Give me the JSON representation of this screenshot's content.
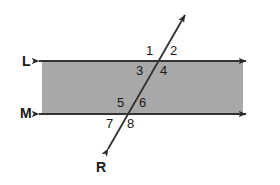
{
  "figure": {
    "type": "geometry-diagram",
    "background_color": "#ffffff",
    "band_fill_color": "#a8a8a8",
    "stroke_color": "#333333",
    "text_color": "#1a1a1a"
  },
  "lines": {
    "upper": {
      "label": "L",
      "label_x": 22,
      "label_y": 54
    },
    "lower": {
      "label": "M",
      "label_y": 106,
      "label_x": 20
    },
    "transversal": {
      "label": "R",
      "label_x": 96,
      "label_y": 160
    }
  },
  "angles": [
    {
      "label": "1",
      "x": 146,
      "y": 44
    },
    {
      "label": "2",
      "x": 170,
      "y": 44
    },
    {
      "label": "3",
      "x": 136,
      "y": 64
    },
    {
      "label": "4",
      "x": 160,
      "y": 64
    },
    {
      "label": "5",
      "x": 117,
      "y": 96
    },
    {
      "label": "6",
      "x": 139,
      "y": 96
    },
    {
      "label": "7",
      "x": 106,
      "y": 117
    },
    {
      "label": "8",
      "x": 127,
      "y": 117
    }
  ]
}
